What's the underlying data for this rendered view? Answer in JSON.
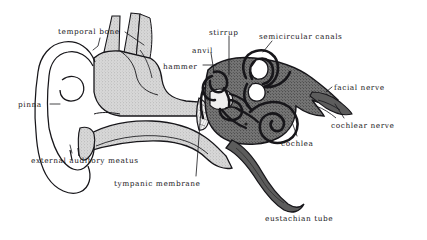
{
  "figure": {
    "kind": "anatomical-diagram",
    "background_color": "#ffffff",
    "ink_color": "#17161a",
    "temporal_bone_fill": "#cfcfcf",
    "inner_ear_fill": "#6e6e6e",
    "membrane_fill": "#f2f2f2"
  },
  "labels": [
    {
      "id": "temporal-bone",
      "text": "temporal bone",
      "x": 58,
      "y": 28,
      "leaders": [
        [
          [
            100,
            38
          ],
          [
            98,
            46
          ],
          [
            93,
            50
          ]
        ],
        [
          [
            125,
            32
          ],
          [
            144,
            45
          ]
        ]
      ]
    },
    {
      "id": "pinna",
      "text": "pinna",
      "x": 18,
      "y": 101,
      "leaders": [
        [
          [
            50,
            104
          ],
          [
            60,
            104
          ]
        ]
      ]
    },
    {
      "id": "external-auditory-meatus",
      "text": "external auditory meatus",
      "x": 31,
      "y": 157,
      "leaders": [
        [
          [
            72,
            153
          ],
          [
            70,
            145
          ]
        ]
      ]
    },
    {
      "id": "tympanic-membrane",
      "text": "tympanic membrane",
      "x": 114,
      "y": 180,
      "leaders": [
        [
          [
            196,
            176
          ],
          [
            201,
            110
          ]
        ]
      ]
    },
    {
      "id": "hammer",
      "text": "hammer",
      "x": 163,
      "y": 63,
      "leaders": [
        [
          [
            203,
            65
          ],
          [
            216,
            65
          ]
        ]
      ]
    },
    {
      "id": "anvil",
      "text": "anvil",
      "x": 192,
      "y": 47,
      "leaders": [
        [
          [
            211,
            53
          ],
          [
            214,
            72
          ]
        ]
      ]
    },
    {
      "id": "stirrup",
      "text": "stirrup",
      "x": 209,
      "y": 29,
      "leaders": [
        [
          [
            229,
            36
          ],
          [
            229,
            75
          ]
        ]
      ]
    },
    {
      "id": "semicircular-canals",
      "text": "semicircular canals",
      "x": 259,
      "y": 33,
      "leaders": [
        [
          [
            272,
            41
          ],
          [
            263,
            52
          ]
        ]
      ]
    },
    {
      "id": "facial-nerve",
      "text": "facial nerve",
      "x": 334,
      "y": 84,
      "leaders": [
        [
          [
            332,
            87
          ],
          [
            326,
            92
          ]
        ]
      ]
    },
    {
      "id": "cochlear-nerve",
      "text": "cochlear nerve",
      "x": 331,
      "y": 122,
      "leaders": [
        [
          [
            344,
            118
          ],
          [
            335,
            104
          ]
        ]
      ]
    },
    {
      "id": "cochlea",
      "text": "cochlea",
      "x": 281,
      "y": 140,
      "leaders": [
        [
          [
            297,
            136
          ],
          [
            292,
            122
          ]
        ]
      ]
    },
    {
      "id": "eustachian-tube",
      "text": "eustachian tube",
      "x": 265,
      "y": 215,
      "leaders": []
    }
  ]
}
